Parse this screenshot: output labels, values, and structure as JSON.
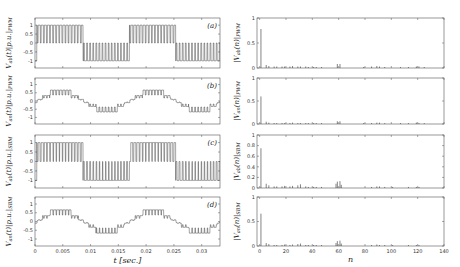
{
  "chart_data": [
    {
      "id": "a",
      "type": "line",
      "panel_label": "(a)",
      "ylabel": "V_ab(t)|p.u.|_PWM",
      "xlabel": "",
      "xlim": [
        0,
        0.0333
      ],
      "ylim": [
        -1.4,
        1.4
      ],
      "yticks": [
        1,
        0.5,
        0,
        -0.5,
        -1
      ],
      "ytick_labels": [
        "1",
        "0.5",
        "0",
        "-0.5",
        "-1"
      ],
      "waveform": "pwm_line",
      "levels": [
        -1,
        0,
        1
      ],
      "fundamental_hz": 60,
      "carrier_ratio": 15
    },
    {
      "id": "b",
      "type": "line",
      "panel_label": "(b)",
      "ylabel": "V_an(t)|p.u.|_PWM",
      "xlabel": "",
      "xlim": [
        0,
        0.0333
      ],
      "ylim": [
        -1.4,
        1.4
      ],
      "yticks": [
        1,
        0.5,
        0,
        -0.5,
        -1
      ],
      "ytick_labels": [
        "1",
        "0.5",
        "0",
        "-0.5",
        "-1"
      ],
      "waveform": "pwm_phase",
      "levels": [
        -0.667,
        -0.333,
        0,
        0.333,
        0.667
      ],
      "fundamental_hz": 60,
      "carrier_ratio": 15
    },
    {
      "id": "c",
      "type": "line",
      "panel_label": "(c)",
      "ylabel": "V_ab(t)|p.u.|_SBM",
      "xlabel": "",
      "xlim": [
        0,
        0.0333
      ],
      "ylim": [
        -1.4,
        1.4
      ],
      "yticks": [
        1,
        0.5,
        0,
        -0.5,
        -1
      ],
      "ytick_labels": [
        "1",
        "0.5",
        "0",
        "-0.5",
        "-1"
      ],
      "waveform": "sbm_line",
      "levels": [
        -1,
        0,
        1
      ],
      "fundamental_hz": 60,
      "carrier_ratio": 15
    },
    {
      "id": "d",
      "type": "line",
      "panel_label": "(d)",
      "ylabel": "V_an(t)|p.u.|_SBM",
      "xlabel": "t [sec.]",
      "xlim": [
        0,
        0.0333
      ],
      "ylim": [
        -1.4,
        1.4
      ],
      "yticks": [
        1,
        0.5,
        0,
        -0.5,
        -1
      ],
      "ytick_labels": [
        "1",
        "0.5",
        "0",
        "-0.5",
        "-1"
      ],
      "xticks": [
        0,
        0.005,
        0.01,
        0.015,
        0.02,
        0.025,
        0.03
      ],
      "xtick_labels": [
        "0",
        "0.005",
        "0.01",
        "0.015",
        "0.02",
        "0.025",
        "0.03"
      ],
      "waveform": "sbm_phase",
      "levels": [
        -0.667,
        -0.333,
        0,
        0.333,
        0.667
      ],
      "fundamental_hz": 60,
      "carrier_ratio": 15
    },
    {
      "id": "e",
      "type": "bar",
      "ylabel": "|V_ab(n)|_PWM",
      "xlabel": "",
      "xlim": [
        -2,
        140
      ],
      "ylim": [
        0,
        1
      ],
      "yticks": [
        0,
        0.5,
        1
      ],
      "ytick_labels": [
        "0",
        "0.5",
        "1"
      ],
      "harmonics": [
        {
          "n": 1,
          "v": 0.78
        },
        {
          "n": 5,
          "v": 0.06
        },
        {
          "n": 7,
          "v": 0.04
        },
        {
          "n": 11,
          "v": 0.03
        },
        {
          "n": 13,
          "v": 0.03
        },
        {
          "n": 17,
          "v": 0.03
        },
        {
          "n": 19,
          "v": 0.03
        },
        {
          "n": 23,
          "v": 0.03
        },
        {
          "n": 25,
          "v": 0.04
        },
        {
          "n": 29,
          "v": 0.03
        },
        {
          "n": 31,
          "v": 0.03
        },
        {
          "n": 35,
          "v": 0.03
        },
        {
          "n": 37,
          "v": 0.02
        },
        {
          "n": 41,
          "v": 0.02
        },
        {
          "n": 43,
          "v": 0.02
        },
        {
          "n": 47,
          "v": 0.02
        },
        {
          "n": 59,
          "v": 0.08
        },
        {
          "n": 61,
          "v": 0.08
        },
        {
          "n": 79,
          "v": 0.02
        },
        {
          "n": 85,
          "v": 0.03
        },
        {
          "n": 89,
          "v": 0.04
        },
        {
          "n": 91,
          "v": 0.03
        },
        {
          "n": 95,
          "v": 0.02
        },
        {
          "n": 107,
          "v": 0.02
        },
        {
          "n": 113,
          "v": 0.02
        },
        {
          "n": 119,
          "v": 0.03
        },
        {
          "n": 121,
          "v": 0.03
        },
        {
          "n": 125,
          "v": 0.02
        }
      ]
    },
    {
      "id": "f",
      "type": "bar",
      "ylabel": "|V_an(n)|_PWM",
      "xlabel": "",
      "xlim": [
        -2,
        140
      ],
      "ylim": [
        0,
        1
      ],
      "yticks": [
        0,
        0.5,
        1
      ],
      "ytick_labels": [
        "0",
        "0.5",
        "1"
      ],
      "harmonics": [
        {
          "n": 1,
          "v": 0.6
        },
        {
          "n": 5,
          "v": 0.05
        },
        {
          "n": 7,
          "v": 0.03
        },
        {
          "n": 11,
          "v": 0.02
        },
        {
          "n": 13,
          "v": 0.02
        },
        {
          "n": 17,
          "v": 0.02
        },
        {
          "n": 19,
          "v": 0.02
        },
        {
          "n": 23,
          "v": 0.02
        },
        {
          "n": 25,
          "v": 0.03
        },
        {
          "n": 29,
          "v": 0.02
        },
        {
          "n": 31,
          "v": 0.02
        },
        {
          "n": 35,
          "v": 0.02
        },
        {
          "n": 37,
          "v": 0.02
        },
        {
          "n": 41,
          "v": 0.02
        },
        {
          "n": 43,
          "v": 0.02
        },
        {
          "n": 47,
          "v": 0.02
        },
        {
          "n": 59,
          "v": 0.06
        },
        {
          "n": 61,
          "v": 0.06
        },
        {
          "n": 79,
          "v": 0.02
        },
        {
          "n": 85,
          "v": 0.02
        },
        {
          "n": 89,
          "v": 0.03
        },
        {
          "n": 91,
          "v": 0.03
        },
        {
          "n": 95,
          "v": 0.02
        },
        {
          "n": 107,
          "v": 0.02
        },
        {
          "n": 113,
          "v": 0.02
        },
        {
          "n": 119,
          "v": 0.03
        },
        {
          "n": 121,
          "v": 0.02
        },
        {
          "n": 125,
          "v": 0.02
        }
      ]
    },
    {
      "id": "g",
      "type": "bar",
      "ylabel": "|V_ab(n)|_SBM",
      "xlabel": "",
      "xlim": [
        -2,
        140
      ],
      "ylim": [
        0,
        1
      ],
      "yticks": [
        0,
        0.2,
        0.4,
        0.6,
        0.8,
        1
      ],
      "ytick_labels": [
        "0",
        "0.2",
        "0.4",
        "0.6",
        "0.8",
        "1"
      ],
      "harmonics": [
        {
          "n": 1,
          "v": 0.75
        },
        {
          "n": 5,
          "v": 0.08
        },
        {
          "n": 7,
          "v": 0.05
        },
        {
          "n": 11,
          "v": 0.03
        },
        {
          "n": 13,
          "v": 0.03
        },
        {
          "n": 17,
          "v": 0.03
        },
        {
          "n": 19,
          "v": 0.04
        },
        {
          "n": 23,
          "v": 0.03
        },
        {
          "n": 25,
          "v": 0.04
        },
        {
          "n": 29,
          "v": 0.05
        },
        {
          "n": 31,
          "v": 0.07
        },
        {
          "n": 35,
          "v": 0.03
        },
        {
          "n": 37,
          "v": 0.02
        },
        {
          "n": 41,
          "v": 0.02
        },
        {
          "n": 43,
          "v": 0.02
        },
        {
          "n": 47,
          "v": 0.02
        },
        {
          "n": 58,
          "v": 0.08
        },
        {
          "n": 59,
          "v": 0.12
        },
        {
          "n": 61,
          "v": 0.13
        },
        {
          "n": 62,
          "v": 0.06
        },
        {
          "n": 85,
          "v": 0.02
        },
        {
          "n": 89,
          "v": 0.03
        },
        {
          "n": 91,
          "v": 0.03
        },
        {
          "n": 95,
          "v": 0.02
        },
        {
          "n": 101,
          "v": 0.02
        },
        {
          "n": 113,
          "v": 0.02
        },
        {
          "n": 119,
          "v": 0.02
        },
        {
          "n": 121,
          "v": 0.02
        }
      ]
    },
    {
      "id": "h",
      "type": "bar",
      "ylabel": "|V_an(n)|_SBM",
      "xlabel": "n",
      "xlim": [
        -2,
        140
      ],
      "ylim": [
        0,
        1
      ],
      "yticks": [
        0,
        0.5,
        1
      ],
      "ytick_labels": [
        "0",
        "0.5",
        "1"
      ],
      "xticks": [
        0,
        20,
        40,
        60,
        80,
        100,
        120,
        140
      ],
      "xtick_labels": [
        "0",
        "20",
        "40",
        "60",
        "80",
        "100",
        "120",
        "140"
      ],
      "harmonics": [
        {
          "n": 1,
          "v": 0.66
        },
        {
          "n": 5,
          "v": 0.06
        },
        {
          "n": 7,
          "v": 0.04
        },
        {
          "n": 11,
          "v": 0.02
        },
        {
          "n": 13,
          "v": 0.02
        },
        {
          "n": 17,
          "v": 0.02
        },
        {
          "n": 19,
          "v": 0.03
        },
        {
          "n": 23,
          "v": 0.02
        },
        {
          "n": 25,
          "v": 0.03
        },
        {
          "n": 29,
          "v": 0.04
        },
        {
          "n": 31,
          "v": 0.05
        },
        {
          "n": 35,
          "v": 0.02
        },
        {
          "n": 37,
          "v": 0.02
        },
        {
          "n": 41,
          "v": 0.02
        },
        {
          "n": 43,
          "v": 0.02
        },
        {
          "n": 47,
          "v": 0.02
        },
        {
          "n": 58,
          "v": 0.06
        },
        {
          "n": 59,
          "v": 0.1
        },
        {
          "n": 61,
          "v": 0.11
        },
        {
          "n": 62,
          "v": 0.05
        },
        {
          "n": 85,
          "v": 0.02
        },
        {
          "n": 89,
          "v": 0.03
        },
        {
          "n": 91,
          "v": 0.02
        },
        {
          "n": 95,
          "v": 0.02
        },
        {
          "n": 101,
          "v": 0.02
        },
        {
          "n": 113,
          "v": 0.02
        },
        {
          "n": 119,
          "v": 0.02
        },
        {
          "n": 121,
          "v": 0.02
        }
      ]
    }
  ],
  "layout": {
    "left_panels": [
      {
        "id": "a",
        "x0": 35,
        "y0": 18,
        "x1": 220,
        "y1": 68
      },
      {
        "id": "b",
        "x0": 35,
        "y0": 78,
        "x1": 220,
        "y1": 124
      },
      {
        "id": "c",
        "x0": 35,
        "y0": 135,
        "x1": 220,
        "y1": 188
      },
      {
        "id": "d",
        "x0": 35,
        "y0": 197,
        "x1": 220,
        "y1": 246
      }
    ],
    "right_panels": [
      {
        "id": "e",
        "x0": 257,
        "y0": 18,
        "x1": 444,
        "y1": 68
      },
      {
        "id": "f",
        "x0": 257,
        "y0": 78,
        "x1": 444,
        "y1": 124
      },
      {
        "id": "g",
        "x0": 257,
        "y0": 135,
        "x1": 444,
        "y1": 188
      },
      {
        "id": "h",
        "x0": 257,
        "y0": 197,
        "x1": 444,
        "y1": 246
      }
    ]
  },
  "colors": {
    "axis": "#555555",
    "trace": "#333333",
    "background": "#ffffff"
  }
}
